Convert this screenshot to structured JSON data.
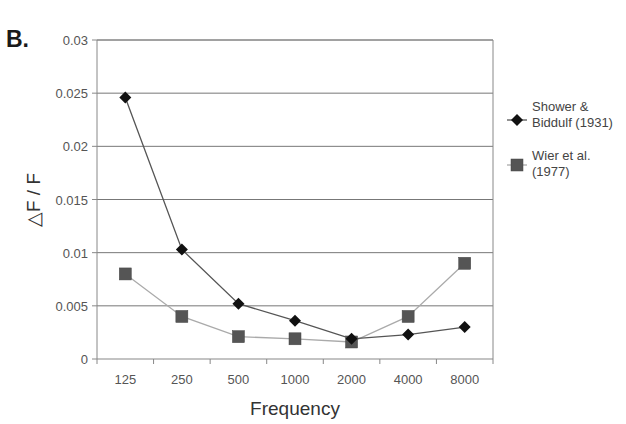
{
  "panel_label": "B.",
  "chart_data": {
    "type": "line",
    "title": "",
    "xlabel": "Frequency",
    "ylabel": "△F / F",
    "categories": [
      "125",
      "250",
      "500",
      "1000",
      "2000",
      "4000",
      "8000"
    ],
    "ylim": [
      0,
      0.03
    ],
    "yticks": [
      "0",
      "0.005",
      "0.01",
      "0.015",
      "0.02",
      "0.025",
      "0.03"
    ],
    "grid": true,
    "legend_position": "right",
    "series": [
      {
        "name": "Shower & Biddulf (1931)",
        "legend_lines": [
          "Shower &",
          "Biddulf (1931)"
        ],
        "marker": "diamond",
        "values": [
          0.0246,
          0.0103,
          0.0052,
          0.0036,
          0.0019,
          0.0023,
          0.003
        ]
      },
      {
        "name": "Wier et al. (1977)",
        "legend_lines": [
          "Wier et al.",
          "(1977)"
        ],
        "marker": "square",
        "values": [
          0.008,
          0.004,
          0.0021,
          0.0019,
          0.0016,
          0.004,
          0.009
        ]
      }
    ]
  },
  "colors": {
    "series_1_line": "#555555",
    "series_1_marker": "#111111",
    "series_2_line": "#aaaaaa",
    "series_2_marker": "#555555",
    "grid": "#777777",
    "axis": "#888888"
  }
}
